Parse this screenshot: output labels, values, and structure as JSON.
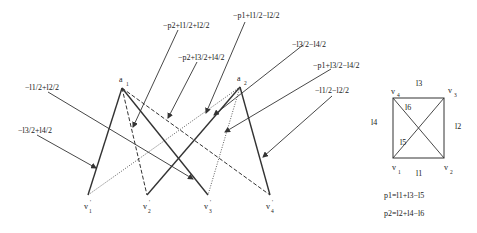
{
  "diagram": {
    "top_nodes": [
      {
        "name": "a",
        "sub": "1",
        "x": 122,
        "y": 88
      },
      {
        "name": "a",
        "sub": "2",
        "x": 240,
        "y": 87
      }
    ],
    "bottom_nodes": [
      {
        "name": "v",
        "sub": "1",
        "prime": "'",
        "x": 88,
        "y": 195
      },
      {
        "name": "v",
        "sub": "2",
        "prime": "'",
        "x": 147,
        "y": 195
      },
      {
        "name": "v",
        "sub": "3",
        "prime": "'",
        "x": 208,
        "y": 195
      },
      {
        "name": "v",
        "sub": "4",
        "prime": "'",
        "x": 270,
        "y": 195
      }
    ],
    "edges": [
      {
        "from": "a1",
        "to": "v1'",
        "style": "solid"
      },
      {
        "from": "a1",
        "to": "v2'",
        "style": "dashed"
      },
      {
        "from": "a1",
        "to": "v3'",
        "style": "solid"
      },
      {
        "from": "a1",
        "to": "v4'",
        "style": "dashed"
      },
      {
        "from": "a2",
        "to": "v1'",
        "style": "dotted"
      },
      {
        "from": "a2",
        "to": "v2'",
        "style": "solid"
      },
      {
        "from": "a2",
        "to": "v3'",
        "style": "dotted"
      },
      {
        "from": "a2",
        "to": "v4'",
        "style": "solid"
      }
    ],
    "annotations": [
      {
        "text": "−p2+l1/2+l2/2"
      },
      {
        "text": "−p1+l1/2−l2/2"
      },
      {
        "text": "−p2+l3/2+l4/2"
      },
      {
        "text": "−l3/2−l4/2"
      },
      {
        "text": "−p1+l3/2−l4/2"
      },
      {
        "text": "−l1/2+l2/2"
      },
      {
        "text": "−l1/2−l2/2"
      },
      {
        "text": "−l3/2+l4/2"
      }
    ]
  },
  "square": {
    "corners": [
      {
        "name": "v",
        "sub": "4"
      },
      {
        "name": "v",
        "sub": "3"
      },
      {
        "name": "v",
        "sub": "1"
      },
      {
        "name": "v",
        "sub": "2"
      }
    ],
    "edges": {
      "top": "l3",
      "right": "l2",
      "bottom": "l1",
      "left": "l4"
    },
    "diagonals": {
      "upper": "l6",
      "lower": "l5"
    }
  },
  "equations": [
    "p1=l1+l3−l5",
    "p2=l2+l4−l6"
  ]
}
